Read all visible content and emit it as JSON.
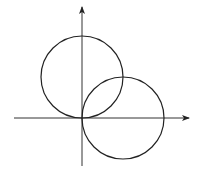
{
  "diagram": {
    "stroke_color": "#222222",
    "background_color": "#ffffff",
    "axes": {
      "x_axis": {
        "direction": "right",
        "arrow": true
      },
      "y_axis": {
        "direction": "up",
        "arrow": true
      }
    },
    "circles": [
      {
        "name": "circle-on-y-axis",
        "center": [
          0,
          1
        ],
        "radius": 1
      },
      {
        "name": "circle-on-x-axis",
        "center": [
          1,
          0
        ],
        "radius": 1
      }
    ]
  }
}
